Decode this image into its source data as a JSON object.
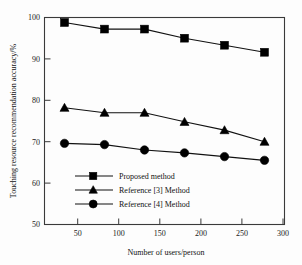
{
  "chart_data": {
    "type": "line",
    "title": "",
    "xlabel": "Number of users/person",
    "ylabel": "Touching resource recommendation accuracy/%",
    "x": [
      50,
      100,
      150,
      200,
      250,
      300
    ],
    "xticklabels": [
      "50",
      "100",
      "150",
      "200",
      "250",
      "300"
    ],
    "yticklabels": [
      "50",
      "60",
      "70",
      "80",
      "90",
      "100"
    ],
    "yticks": [
      50,
      60,
      70,
      80,
      90,
      100
    ],
    "xlim": [
      25,
      325
    ],
    "ylim": [
      50,
      100
    ],
    "grid": false,
    "legend_position": "lower-left-inside",
    "series": [
      {
        "name": "Proposed method",
        "marker": "square",
        "values": [
          98.8,
          97.2,
          97.2,
          95.0,
          93.3,
          91.6
        ]
      },
      {
        "name": "Reference [3] Method",
        "marker": "triangle",
        "values": [
          78.2,
          77.0,
          77.0,
          74.8,
          72.8,
          70.0
        ]
      },
      {
        "name": "Reference [4] Method",
        "marker": "circle",
        "values": [
          69.6,
          69.3,
          68.0,
          67.3,
          66.4,
          65.5
        ]
      }
    ]
  },
  "colors": {
    "line": "#111111",
    "marker": "#000000",
    "frame": "#3a3a3a",
    "background": "#fdfdfd"
  },
  "axis": {
    "x_title": "Number of users/person",
    "y_title": "Touching resource recommendation accuracy/%",
    "x_tick_0": "50",
    "x_tick_1": "100",
    "x_tick_2": "150",
    "x_tick_3": "200",
    "x_tick_4": "250",
    "x_tick_5": "300",
    "y_tick_0": "50",
    "y_tick_1": "60",
    "y_tick_2": "70",
    "y_tick_3": "80",
    "y_tick_4": "90",
    "y_tick_5": "100"
  },
  "legend": {
    "item_0": "Proposed method",
    "item_1": "Reference [3] Method",
    "item_2": "Reference [4] Method"
  }
}
